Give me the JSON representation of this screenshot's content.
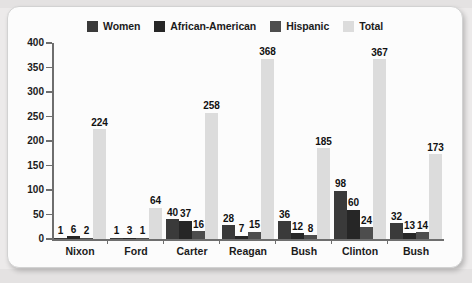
{
  "chart_data": {
    "type": "bar",
    "title": "",
    "xlabel": "",
    "ylabel": "",
    "ylim": [
      0,
      400
    ],
    "ytick_step": 50,
    "yticks": [
      400,
      350,
      300,
      250,
      200,
      150,
      100,
      50,
      0
    ],
    "grid": false,
    "legend_position": "top-center",
    "categories": [
      "Nixon",
      "Ford",
      "Carter",
      "Reagan",
      "Bush",
      "Clinton",
      "Bush"
    ],
    "series": [
      {
        "name": "Women",
        "color": "#3a3a3a",
        "values": [
          1,
          1,
          40,
          28,
          36,
          98,
          32
        ]
      },
      {
        "name": "African-American",
        "color": "#262626",
        "values": [
          6,
          3,
          37,
          7,
          12,
          60,
          13
        ]
      },
      {
        "name": "Hispanic",
        "color": "#4d4d4d",
        "values": [
          2,
          1,
          16,
          15,
          8,
          24,
          14
        ]
      },
      {
        "name": "Total",
        "color": "#dcdcdc",
        "values": [
          224,
          64,
          258,
          368,
          185,
          367,
          173
        ]
      }
    ]
  },
  "colors": {
    "women": "#3a3a3a",
    "african_american": "#262626",
    "hispanic": "#4d4d4d",
    "total": "#dcdcdc",
    "axis": "#6e6e6e",
    "card_background": "#fcfcfc",
    "page_background": "#eceaea",
    "text": "#1b1b1b"
  }
}
